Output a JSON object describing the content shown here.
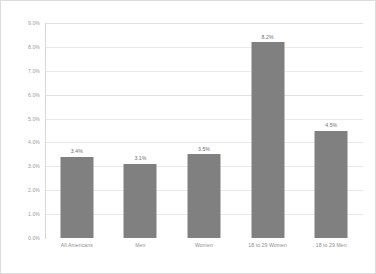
{
  "chart_data": {
    "type": "bar",
    "title": "",
    "xlabel": "",
    "ylabel": "",
    "ylim": [
      0,
      9
    ],
    "grid": true,
    "legend": false,
    "categories": [
      "All Americans",
      "Men",
      "Women",
      "18 to 29 Women",
      "18 to 29 Men"
    ],
    "values": [
      3.4,
      3.1,
      3.5,
      8.2,
      4.5
    ],
    "data_labels": [
      "3.4%",
      "3.1%",
      "3.5%",
      "8.2%",
      "4.5%"
    ],
    "y_ticks": [
      9,
      8,
      7,
      6,
      5,
      4,
      3,
      2,
      1,
      0
    ],
    "y_tick_labels": [
      "9.0%",
      "8.0%",
      "7.0%",
      "6.0%",
      "5.0%",
      "4.0%",
      "3.0%",
      "2.0%",
      "1.0%",
      "0.0%"
    ],
    "bar_color": "#808080",
    "gridline_color": "#e9e9e9",
    "axis_color": "#d8d8d8",
    "label_color": "#9a9a9a"
  }
}
